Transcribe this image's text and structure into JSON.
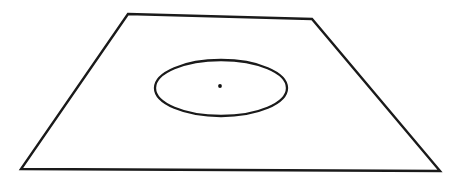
{
  "figure": {
    "background_color": "#ffffff",
    "canvas": {
      "width": 462,
      "height": 185
    },
    "stroke_color": "#1a1a1a",
    "fill_color": "#ffffff",
    "shapes": {
      "plane": {
        "name": "trapezoid-plane",
        "kind": "polygon",
        "stroke_width": 2.4,
        "points": "128,14 312,19 440,171 21,169",
        "vertices": [
          {
            "label": "top-left",
            "x": 128,
            "y": 14
          },
          {
            "label": "top-right",
            "x": 312,
            "y": 19
          },
          {
            "label": "bottom-right",
            "x": 440,
            "y": 171
          },
          {
            "label": "bottom-left",
            "x": 21,
            "y": 169
          }
        ]
      },
      "ellipse": {
        "name": "inscribed-ellipse",
        "kind": "ellipse",
        "stroke_width": 2.3,
        "cx": 221,
        "cy": 88,
        "rx": 66,
        "ry": 28
      },
      "center_point": {
        "name": "ellipse-center-point",
        "kind": "dot",
        "cx": 220,
        "cy": 86,
        "r": 1.9,
        "color": "#111111"
      }
    }
  }
}
